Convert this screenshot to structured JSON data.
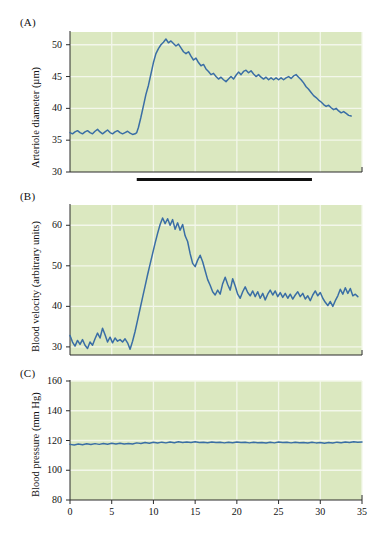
{
  "figure": {
    "background_color": "#ffffff",
    "plot_background_color": "#dbe8c0",
    "trace_color": "#3a6ea5",
    "grid_color": "#f3f7ea",
    "axis_color": "#2b2b2b",
    "stimulus_bar_color": "#111111"
  },
  "panels": [
    {
      "letter": "(A)",
      "ylabel": "Arteriole diameter (µm)",
      "yticks": [
        "50",
        "45",
        "40",
        "35",
        "30"
      ],
      "xticks": [],
      "has_stimulus_bar": true
    },
    {
      "letter": "(B)",
      "ylabel": "Blood velocity (arbitrary units)",
      "yticks": [
        "60",
        "50",
        "40",
        "30"
      ],
      "xticks": [],
      "has_stimulus_bar": false
    },
    {
      "letter": "(C)",
      "ylabel": "Blood pressure (mm Hg)",
      "yticks": [
        "160",
        "140",
        "120",
        "100",
        "80"
      ],
      "xticks": [
        "0",
        "5",
        "10",
        "15",
        "20",
        "25",
        "30",
        "35"
      ],
      "has_stimulus_bar": false
    }
  ],
  "chart_data": [
    {
      "type": "line",
      "panel": "(A)",
      "title": "",
      "xlabel": "",
      "ylabel": "Arteriole diameter (µm)",
      "xlim": [
        0,
        35
      ],
      "ylim": [
        30,
        52
      ],
      "yticks": [
        30,
        35,
        40,
        45,
        50
      ],
      "xticks": [
        0,
        5,
        10,
        15,
        20,
        25,
        30,
        35
      ],
      "grid": true,
      "legend": "none",
      "annotations": [
        {
          "type": "stimulus-bar",
          "x_start": 8.0,
          "x_end": 29.0,
          "label": ""
        }
      ],
      "x": [
        0.0,
        0.3,
        0.6,
        0.9,
        1.2,
        1.5,
        1.8,
        2.1,
        2.4,
        2.7,
        3.0,
        3.3,
        3.6,
        3.9,
        4.2,
        4.5,
        4.8,
        5.1,
        5.4,
        5.7,
        6.0,
        6.3,
        6.6,
        6.9,
        7.2,
        7.5,
        7.8,
        8.0,
        8.2,
        8.5,
        8.8,
        9.1,
        9.4,
        9.7,
        10.0,
        10.3,
        10.6,
        10.9,
        11.2,
        11.5,
        11.8,
        12.1,
        12.4,
        12.7,
        13.0,
        13.3,
        13.6,
        13.9,
        14.2,
        14.5,
        14.8,
        15.1,
        15.4,
        15.7,
        16.0,
        16.3,
        16.6,
        16.9,
        17.2,
        17.5,
        17.8,
        18.1,
        18.4,
        18.7,
        19.0,
        19.3,
        19.6,
        19.9,
        20.2,
        20.5,
        20.8,
        21.1,
        21.4,
        21.7,
        22.0,
        22.3,
        22.6,
        22.9,
        23.2,
        23.5,
        23.8,
        24.1,
        24.4,
        24.7,
        25.0,
        25.3,
        25.6,
        25.9,
        26.2,
        26.5,
        26.8,
        27.1,
        27.4,
        27.7,
        28.0,
        28.3,
        28.6,
        28.9,
        29.2,
        29.5,
        29.8,
        30.1,
        30.4,
        30.7,
        31.0,
        31.3,
        31.6,
        31.9,
        32.2,
        32.5,
        32.8,
        33.1,
        33.4,
        33.7,
        34.0,
        34.3,
        34.6,
        35.0
      ],
      "y": [
        36.2,
        36.0,
        36.3,
        36.5,
        36.2,
        36.0,
        36.3,
        36.5,
        36.2,
        36.0,
        36.4,
        36.7,
        36.3,
        36.0,
        36.3,
        36.6,
        36.2,
        36.0,
        36.3,
        36.5,
        36.2,
        36.0,
        36.2,
        36.4,
        36.1,
        35.9,
        36.0,
        36.2,
        37.0,
        38.6,
        40.4,
        42.2,
        43.6,
        45.4,
        47.2,
        48.6,
        49.4,
        50.0,
        50.4,
        50.9,
        50.3,
        50.6,
        50.2,
        49.8,
        50.1,
        49.5,
        48.9,
        48.6,
        48.9,
        48.2,
        47.6,
        47.9,
        47.2,
        46.7,
        46.9,
        46.2,
        45.8,
        45.3,
        45.5,
        45.0,
        44.6,
        44.9,
        44.5,
        44.2,
        44.6,
        45.0,
        44.6,
        45.2,
        45.7,
        45.3,
        45.8,
        46.0,
        45.6,
        45.9,
        45.4,
        45.0,
        45.3,
        44.9,
        44.6,
        44.9,
        44.5,
        44.8,
        44.5,
        44.8,
        44.5,
        44.8,
        44.5,
        44.8,
        45.0,
        44.7,
        45.1,
        45.3,
        44.9,
        44.5,
        44.0,
        43.4,
        43.0,
        42.5,
        42.0,
        41.7,
        41.3,
        41.0,
        40.6,
        40.3,
        40.5,
        40.1,
        39.8,
        40.0,
        39.6,
        39.3,
        39.5,
        39.2,
        38.9,
        38.8
      ]
    },
    {
      "type": "line",
      "panel": "(B)",
      "title": "",
      "xlabel": "",
      "ylabel": "Blood velocity (arbitrary units)",
      "xlim": [
        0,
        35
      ],
      "ylim": [
        28,
        65
      ],
      "yticks": [
        30,
        40,
        50,
        60
      ],
      "xticks": [
        0,
        5,
        10,
        15,
        20,
        25,
        30,
        35
      ],
      "grid": true,
      "legend": "none",
      "x": [
        0.0,
        0.3,
        0.6,
        0.9,
        1.2,
        1.5,
        1.8,
        2.1,
        2.4,
        2.7,
        3.0,
        3.3,
        3.6,
        3.9,
        4.2,
        4.5,
        4.8,
        5.1,
        5.4,
        5.7,
        6.0,
        6.3,
        6.6,
        6.9,
        7.2,
        7.5,
        7.8,
        8.1,
        8.4,
        8.7,
        9.0,
        9.3,
        9.6,
        9.9,
        10.2,
        10.5,
        10.8,
        11.1,
        11.4,
        11.7,
        12.0,
        12.3,
        12.6,
        12.9,
        13.2,
        13.5,
        13.8,
        14.1,
        14.4,
        14.7,
        15.0,
        15.3,
        15.6,
        15.9,
        16.2,
        16.5,
        16.8,
        17.1,
        17.4,
        17.7,
        18.0,
        18.3,
        18.6,
        18.9,
        19.2,
        19.5,
        19.8,
        20.1,
        20.4,
        20.7,
        21.0,
        21.3,
        21.6,
        21.9,
        22.2,
        22.5,
        22.8,
        23.1,
        23.4,
        23.7,
        24.0,
        24.3,
        24.6,
        24.9,
        25.2,
        25.5,
        25.8,
        26.1,
        26.4,
        26.7,
        27.0,
        27.3,
        27.6,
        27.9,
        28.2,
        28.5,
        28.8,
        29.1,
        29.4,
        29.7,
        30.0,
        30.3,
        30.6,
        30.9,
        31.2,
        31.5,
        31.8,
        32.1,
        32.4,
        32.7,
        33.0,
        33.3,
        33.6,
        33.9,
        34.2,
        34.5
      ],
      "y": [
        32.8,
        31.2,
        30.2,
        31.6,
        30.6,
        31.8,
        30.4,
        29.6,
        31.2,
        30.4,
        32.0,
        33.4,
        32.2,
        34.6,
        33.0,
        31.2,
        32.4,
        31.0,
        32.2,
        31.4,
        31.8,
        31.2,
        32.0,
        31.0,
        29.4,
        31.4,
        33.8,
        36.6,
        39.4,
        42.2,
        45.0,
        47.8,
        50.4,
        53.0,
        55.6,
        58.0,
        60.2,
        61.8,
        60.4,
        61.6,
        60.0,
        61.4,
        59.0,
        60.6,
        58.8,
        60.2,
        57.4,
        56.0,
        53.0,
        50.6,
        49.8,
        51.4,
        52.6,
        51.0,
        48.8,
        46.6,
        45.2,
        43.6,
        42.8,
        44.0,
        43.0,
        45.6,
        47.2,
        45.4,
        44.0,
        46.8,
        45.0,
        43.0,
        42.0,
        43.6,
        44.8,
        43.4,
        42.6,
        43.8,
        42.4,
        43.6,
        42.0,
        43.2,
        41.6,
        43.0,
        44.0,
        42.8,
        43.8,
        42.4,
        43.4,
        42.2,
        43.2,
        42.0,
        43.0,
        41.8,
        42.8,
        43.6,
        42.4,
        43.2,
        41.8,
        42.6,
        41.4,
        42.8,
        43.8,
        42.6,
        43.4,
        42.0,
        41.0,
        40.2,
        41.2,
        40.0,
        41.4,
        42.6,
        44.2,
        43.0,
        44.6,
        43.2,
        44.4,
        42.6,
        43.0,
        42.4
      ]
    },
    {
      "type": "line",
      "panel": "(C)",
      "title": "",
      "xlabel": "",
      "ylabel": "Blood pressure (mm Hg)",
      "xlim": [
        0,
        35
      ],
      "ylim": [
        80,
        160
      ],
      "yticks": [
        80,
        100,
        120,
        140,
        160
      ],
      "xticks": [
        0,
        5,
        10,
        15,
        20,
        25,
        30,
        35
      ],
      "grid": true,
      "legend": "none",
      "x": [
        0.0,
        0.5,
        1.0,
        1.5,
        2.0,
        2.5,
        3.0,
        3.5,
        4.0,
        4.5,
        5.0,
        5.5,
        6.0,
        6.5,
        7.0,
        7.5,
        8.0,
        8.5,
        9.0,
        9.5,
        10.0,
        10.5,
        11.0,
        11.5,
        12.0,
        12.5,
        13.0,
        13.5,
        14.0,
        14.5,
        15.0,
        15.5,
        16.0,
        16.5,
        17.0,
        17.5,
        18.0,
        18.5,
        19.0,
        19.5,
        20.0,
        20.5,
        21.0,
        21.5,
        22.0,
        22.5,
        23.0,
        23.5,
        24.0,
        24.5,
        25.0,
        25.5,
        26.0,
        26.5,
        27.0,
        27.5,
        28.0,
        28.5,
        29.0,
        29.5,
        30.0,
        30.5,
        31.0,
        31.5,
        32.0,
        32.5,
        33.0,
        33.5,
        34.0,
        34.5,
        35.0
      ],
      "y": [
        117.4,
        117.0,
        117.6,
        117.2,
        117.8,
        117.3,
        117.9,
        117.4,
        118.0,
        117.5,
        118.1,
        117.6,
        118.2,
        117.7,
        118.0,
        117.6,
        118.4,
        118.0,
        118.6,
        118.2,
        118.8,
        118.3,
        118.9,
        118.4,
        119.0,
        118.5,
        119.1,
        118.6,
        119.0,
        118.6,
        119.1,
        118.7,
        118.9,
        118.5,
        119.0,
        118.6,
        118.8,
        118.4,
        118.9,
        118.5,
        119.0,
        118.6,
        118.8,
        118.4,
        118.9,
        118.5,
        118.7,
        118.3,
        118.8,
        118.4,
        119.0,
        118.6,
        118.8,
        118.4,
        118.9,
        118.5,
        118.7,
        118.3,
        118.8,
        118.4,
        118.6,
        118.2,
        118.7,
        118.3,
        118.9,
        118.5,
        119.0,
        118.6,
        119.2,
        118.8,
        119.0
      ]
    }
  ]
}
